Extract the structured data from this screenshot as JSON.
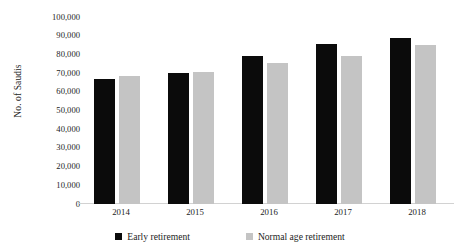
{
  "chart_data": {
    "type": "bar",
    "title": "",
    "subtitle": "",
    "xlabel": "",
    "ylabel": "No. of Saudis",
    "categories": [
      "2014",
      "2015",
      "2016",
      "2017",
      "2018"
    ],
    "series": [
      {
        "name": "Early retirement",
        "color": "#0b0b0b",
        "values": [
          67000,
          70000,
          79000,
          85500,
          89000
        ]
      },
      {
        "name": "Normal age retirement",
        "color": "#c4c4c4",
        "values": [
          68500,
          70500,
          75500,
          79000,
          85000
        ]
      }
    ],
    "ylim": [
      0,
      100000
    ],
    "ytick_values": [
      0,
      10000,
      20000,
      30000,
      40000,
      50000,
      60000,
      70000,
      80000,
      90000,
      100000
    ],
    "ytick_labels": [
      "0",
      "10,000",
      "20,000",
      "30,000",
      "40,000",
      "50,000",
      "60,000",
      "70,000",
      "80,000",
      "90,000",
      "100,000"
    ],
    "grid": false,
    "legend_position": "bottom"
  },
  "axes": {
    "y_title": "No. of Saudis"
  },
  "legend": {
    "items": [
      {
        "label": "Early retirement",
        "color": "#0b0b0b"
      },
      {
        "label": "Normal age retirement",
        "color": "#c4c4c4"
      }
    ]
  }
}
